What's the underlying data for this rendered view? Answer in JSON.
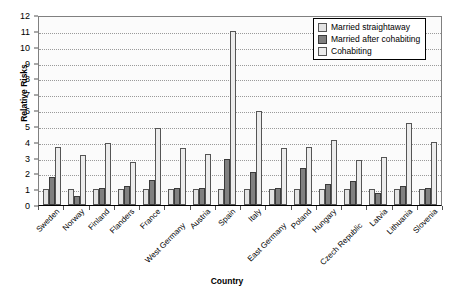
{
  "chart_data": {
    "type": "bar",
    "title": "",
    "xlabel": "Country",
    "ylabel": "Relative Risks",
    "ylim": [
      0,
      12
    ],
    "ytick_step": 1,
    "yticks": [
      "0",
      "1",
      "2",
      "3",
      "4",
      "5",
      "6",
      "7",
      "8",
      "9",
      "10",
      "11",
      "12"
    ],
    "grid": true,
    "legend_position": "top-right",
    "categories": [
      "Sweden",
      "Norway",
      "Finland",
      "Flanders",
      "France",
      "West Germany",
      "Austria",
      "Spain",
      "Italy",
      "East Germany",
      "Poland",
      "Hungary",
      "Czech Republic",
      "Latvia",
      "Lithuania",
      "Slovenia"
    ],
    "series": [
      {
        "name": "Married straightaway",
        "color": "#e3e3e3",
        "values": [
          1.0,
          1.0,
          1.0,
          1.0,
          1.0,
          1.0,
          1.0,
          1.0,
          1.0,
          1.0,
          1.0,
          1.0,
          1.0,
          1.0,
          1.0,
          1.0
        ]
      },
      {
        "name": "Married after cohabiting",
        "color": "#808080",
        "values": [
          1.75,
          0.6,
          1.1,
          1.2,
          1.6,
          1.1,
          1.1,
          2.9,
          2.1,
          1.1,
          2.35,
          1.35,
          1.5,
          0.75,
          1.2,
          1.1
        ]
      },
      {
        "name": "Cohabiting",
        "color": "#ececec",
        "values": [
          3.65,
          3.15,
          3.9,
          2.7,
          4.85,
          3.6,
          3.2,
          11.0,
          5.95,
          3.6,
          3.65,
          4.1,
          2.85,
          3.05,
          5.2,
          3.95
        ]
      }
    ]
  },
  "legend": {
    "items": [
      {
        "label": "Married straightaway"
      },
      {
        "label": "Married after cohabiting"
      },
      {
        "label": "Cohabiting"
      }
    ]
  },
  "axes": {
    "y_title": "Relative Risks",
    "x_title": "Country"
  }
}
